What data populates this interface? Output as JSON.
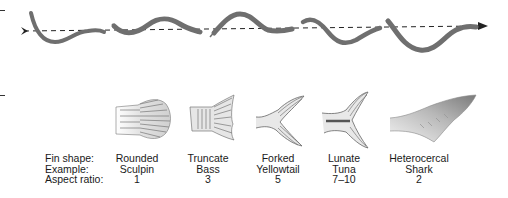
{
  "diagram": {
    "swimming_sequence": {
      "direction": "left-to-right",
      "arrow": "dashed-arrow-right",
      "frames": 5,
      "body_color": "#6f6f6f"
    },
    "row_labels": {
      "fin_shape": "Fin shape:",
      "example": "Example:",
      "aspect_ratio": "Aspect ratio:"
    },
    "fins": [
      {
        "shape": "Rounded",
        "example": "Sculpin",
        "aspect_ratio": "1",
        "icon": "rounded-fin-icon"
      },
      {
        "shape": "Truncate",
        "example": "Bass",
        "aspect_ratio": "3",
        "icon": "truncate-fin-icon"
      },
      {
        "shape": "Forked",
        "example": "Yellowtail",
        "aspect_ratio": "5",
        "icon": "forked-fin-icon"
      },
      {
        "shape": "Lunate",
        "example": "Tuna",
        "aspect_ratio": "7–10",
        "icon": "lunate-fin-icon"
      },
      {
        "shape": "Heterocercal",
        "example": "Shark",
        "aspect_ratio": "2",
        "icon": "heterocercal-fin-icon"
      }
    ],
    "colors": {
      "fin_stroke": "#5a5a5a",
      "fin_fill": "#d6d6d6",
      "text": "#1a1a1a",
      "dash_line": "#222222"
    }
  }
}
